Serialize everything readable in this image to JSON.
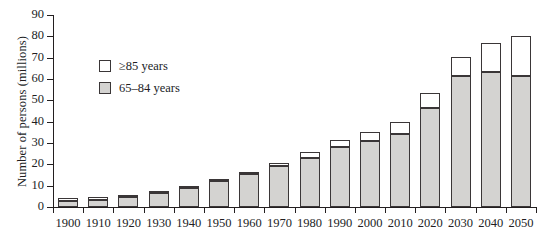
{
  "chart_data": {
    "type": "bar",
    "stacked": true,
    "title": "",
    "xlabel": "",
    "ylabel": "Number of persons (millions)",
    "ylim": [
      0,
      90
    ],
    "yticks": [
      0,
      10,
      20,
      30,
      40,
      50,
      60,
      70,
      80,
      90
    ],
    "grid": false,
    "legend_position": "upper-left-inside",
    "categories": [
      "1900",
      "1910",
      "1920",
      "1930",
      "1940",
      "1950",
      "1960",
      "1970",
      "1980",
      "1990",
      "2000",
      "2010",
      "2020",
      "2030",
      "2040",
      "2050"
    ],
    "series": [
      {
        "name": "65–84 years",
        "color": "#d4d3d1",
        "values": [
          3.0,
          3.5,
          4.8,
          6.5,
          8.8,
          12.0,
          15.6,
          19.0,
          23.2,
          28.2,
          30.9,
          34.3,
          46.5,
          61.5,
          63.2,
          61.5
        ]
      },
      {
        "name": "≥85 years",
        "color": "#ffffff",
        "values": [
          0.1,
          0.2,
          0.2,
          0.3,
          0.4,
          0.6,
          0.9,
          1.4,
          2.5,
          3.0,
          4.1,
          5.7,
          7.0,
          8.8,
          13.8,
          18.5
        ]
      }
    ],
    "totals": [
      3.1,
      3.7,
      5.0,
      6.8,
      9.2,
      12.6,
      16.5,
      20.4,
      25.7,
      31.2,
      35.0,
      40.0,
      53.5,
      70.3,
      77.0,
      80.0
    ]
  },
  "axis": {
    "y_title": "Number of persons (millions)",
    "y_tick_labels": [
      "0",
      "10",
      "20",
      "30",
      "40",
      "50",
      "60",
      "70",
      "80",
      "90"
    ],
    "x_tick_labels": [
      "1900",
      "1910",
      "1920",
      "1930",
      "1940",
      "1950",
      "1960",
      "1970",
      "1980",
      "1990",
      "2000",
      "2010",
      "2020",
      "2030",
      "2040",
      "2050"
    ]
  },
  "legend": {
    "items": [
      {
        "label": "≥85 years",
        "swatch": "white"
      },
      {
        "label": "65–84 years",
        "swatch": "gray"
      }
    ]
  },
  "colors": {
    "ink": "#231f20",
    "lower_fill": "#d4d3d1",
    "upper_fill": "#ffffff",
    "background": "#ffffff"
  }
}
